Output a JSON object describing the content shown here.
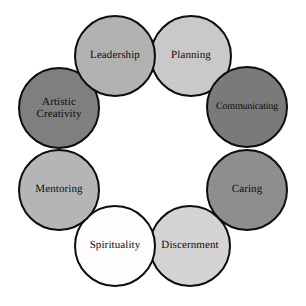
{
  "diagram": {
    "type": "circular-cluster",
    "title": "",
    "background_color": "#ffffff",
    "outline_color": "#0d0d0d",
    "text_color": "#100c08",
    "ring": {
      "center_x": 153,
      "center_y": 153,
      "ring_radius": 93,
      "node_radius": 41
    },
    "nodes": [
      {
        "id": "leadership",
        "label": "Leadership",
        "fill": "#b2b2b2",
        "x": 74,
        "y": 15,
        "z": 5,
        "angle_deg": 292.5,
        "lines": 1
      },
      {
        "id": "planning",
        "label": "Planning",
        "fill": "#c9c9c9",
        "x": 150,
        "y": 15,
        "z": 4,
        "angle_deg": 337.5,
        "lines": 1
      },
      {
        "id": "communicating",
        "label": "Communicating",
        "fill": "#7a7a7a",
        "x": 206,
        "y": 66,
        "z": 6,
        "angle_deg": 22.5,
        "lines": 1
      },
      {
        "id": "caring",
        "label": "Caring",
        "fill": "#8e8e8e",
        "x": 206,
        "y": 149,
        "z": 7,
        "angle_deg": 67.5,
        "lines": 1
      },
      {
        "id": "discernment",
        "label": "Discernment",
        "fill": "#d4d4d4",
        "x": 149,
        "y": 205,
        "z": 3,
        "angle_deg": 112.5,
        "lines": 1
      },
      {
        "id": "spirituality",
        "label": "Spirituality",
        "fill": "#fdfdfd",
        "x": 74,
        "y": 205,
        "z": 8,
        "angle_deg": 157.5,
        "lines": 1
      },
      {
        "id": "mentoring",
        "label": "Mentoring",
        "fill": "#b5b5b5",
        "x": 18,
        "y": 149,
        "z": 9,
        "angle_deg": 202.5,
        "lines": 1
      },
      {
        "id": "artistic_creativity",
        "label": "Artistic\nCreativity",
        "fill": "#7f7f7f",
        "x": 18,
        "y": 67,
        "z": 2,
        "angle_deg": 247.5,
        "lines": 2
      }
    ]
  }
}
